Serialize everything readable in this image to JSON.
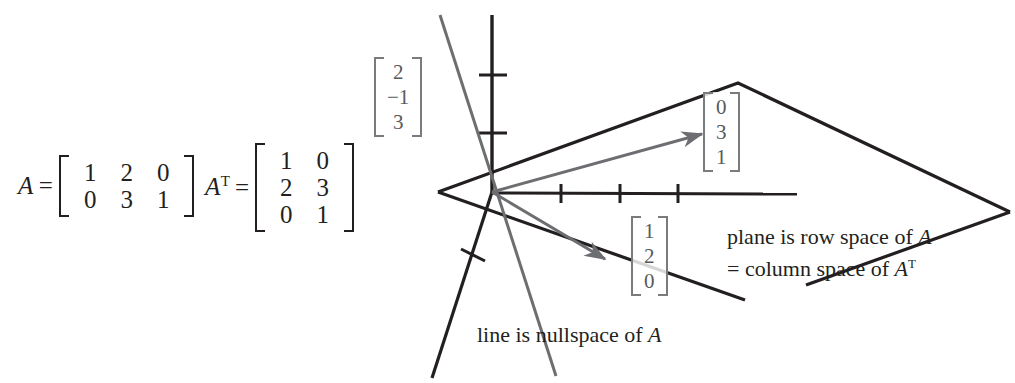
{
  "figure": {
    "matrices": [
      {
        "name": "A",
        "transpose": false,
        "name_display": "A",
        "equals": "=",
        "rows": [
          [
            "1",
            "2",
            "0"
          ],
          [
            "0",
            "3",
            "1"
          ]
        ]
      },
      {
        "name": "A-transpose",
        "transpose": true,
        "name_display": "A",
        "transpose_mark": "T",
        "equals": "=",
        "rows": [
          [
            "1",
            "0"
          ],
          [
            "2",
            "3"
          ],
          [
            "0",
            "1"
          ]
        ]
      }
    ],
    "vector_labels": [
      {
        "id": "nullspace-vector",
        "entries": [
          "2",
          "−1",
          "3"
        ]
      },
      {
        "id": "row-space-vector-1",
        "entries": [
          "0",
          "3",
          "1"
        ]
      },
      {
        "id": "row-space-vector-2",
        "entries": [
          "1",
          "2",
          "0"
        ]
      }
    ],
    "captions": {
      "row_space_line1_pre": "plane is row space of ",
      "row_space_line1_italic": "A",
      "col_space_line2_pre": "= column space of ",
      "col_space_line2_italic": "A",
      "col_space_line2_sup": "T",
      "nullspace_pre": "line is nullspace of ",
      "nullspace_italic": "A"
    },
    "colors": {
      "ink": "#231f20",
      "gray_vector": "#6d6e71",
      "label_gray": "#58595b",
      "background": "#ffffff"
    },
    "geometry": {
      "origin": [
        492,
        192
      ],
      "plane_vertices": [
        [
          438,
          192
        ],
        [
          738,
          83
        ],
        [
          1010,
          212
        ],
        [
          745,
          300
        ]
      ],
      "x_axis": [
        [
          492,
          192
        ],
        [
          797,
          194
        ]
      ],
      "x_axis_ticks": [
        561,
        620,
        678
      ],
      "y_axis": [
        [
          492,
          192
        ],
        [
          492,
          15
        ]
      ],
      "y_axis_ticks": [
        133,
        75
      ],
      "z_axis": [
        [
          492,
          192
        ],
        [
          432,
          378
        ]
      ],
      "z_axis_tick": [
        472,
        255
      ],
      "nullspace_line": [
        [
          440,
          15
        ],
        [
          556,
          376
        ]
      ],
      "arrow_1": [
        [
          492,
          192
        ],
        [
          706,
          133
        ]
      ],
      "arrow_2": [
        [
          492,
          192
        ],
        [
          610,
          263
        ]
      ]
    }
  }
}
